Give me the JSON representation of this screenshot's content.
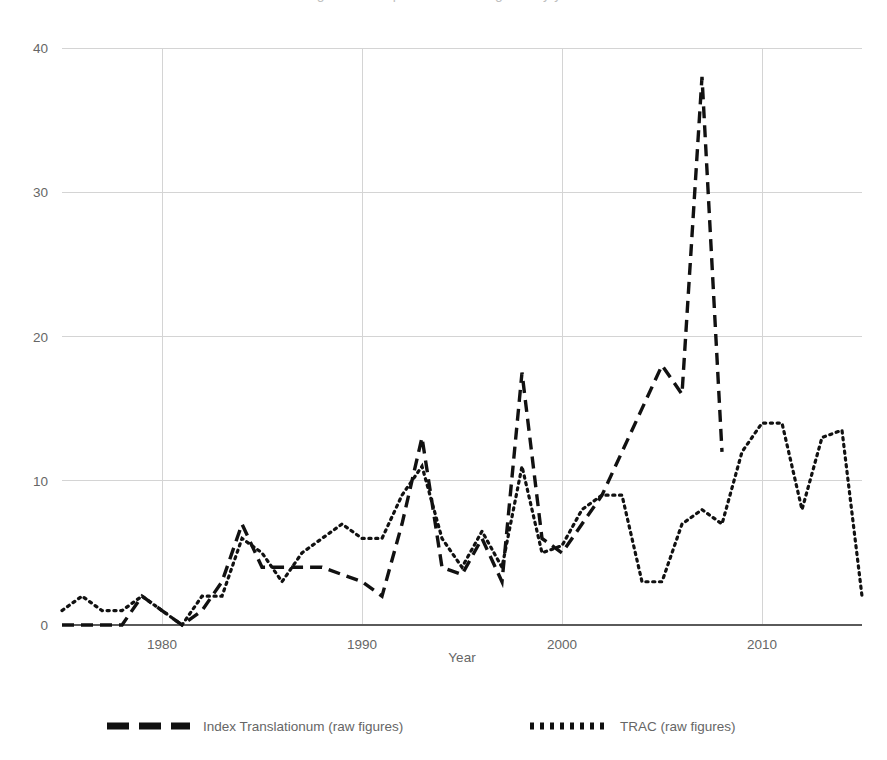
{
  "title_cut": "Figure 1: comparison of raw figures by year",
  "axes": {
    "x_label": "Year",
    "y_label": "",
    "x_ticks": [
      "1980",
      "1990",
      "2000",
      "2010"
    ],
    "y_ticks": [
      "0",
      "10",
      "20",
      "30",
      "40"
    ]
  },
  "legend": {
    "position": "bottom",
    "items": [
      {
        "label": "Index Translationum (raw figures)",
        "style": "dashed",
        "marker": "dash-swatch"
      },
      {
        "label": "TRAC (raw figures)",
        "style": "dotted",
        "marker": "dot-swatch"
      }
    ]
  },
  "colors": {
    "line": "#111111",
    "grid": "#d4d4d4",
    "axis": "#5a5a5a",
    "text": "#666666",
    "background": "#ffffff"
  },
  "chart_data": {
    "type": "line",
    "title": "",
    "xlabel": "Year",
    "ylabel": "",
    "xlim": [
      1975,
      2015
    ],
    "ylim": [
      0,
      40
    ],
    "yticks": [
      0,
      10,
      20,
      30,
      40
    ],
    "xticks": [
      1980,
      1990,
      2000,
      2010
    ],
    "grid": true,
    "legend_position": "bottom",
    "x": [
      1975,
      1976,
      1977,
      1978,
      1979,
      1980,
      1981,
      1982,
      1983,
      1984,
      1985,
      1986,
      1987,
      1988,
      1989,
      1990,
      1991,
      1992,
      1993,
      1994,
      1995,
      1996,
      1997,
      1998,
      1999,
      2000,
      2001,
      2002,
      2003,
      2004,
      2005,
      2006,
      2007,
      2008,
      2009,
      2010,
      2011,
      2012,
      2013,
      2014,
      2015
    ],
    "series": [
      {
        "name": "Index Translationum (raw figures)",
        "style": "dashed",
        "x": [
          1975,
          1976,
          1977,
          1978,
          1979,
          1980,
          1981,
          1982,
          1983,
          1984,
          1985,
          1986,
          1987,
          1988,
          1989,
          1990,
          1991,
          1992,
          1993,
          1994,
          1995,
          1996,
          1997,
          1998,
          1999,
          2000,
          2001,
          2002,
          2003,
          2004,
          2005,
          2006,
          2007,
          2008
        ],
        "values": [
          0,
          0,
          0,
          0,
          2,
          1,
          0,
          1,
          3,
          7,
          4,
          4,
          4,
          4,
          3.5,
          3,
          2,
          7,
          13,
          4,
          3.5,
          6,
          3,
          17.5,
          6,
          5,
          7,
          9,
          12,
          15,
          18,
          16,
          38,
          12
        ]
      },
      {
        "name": "TRAC (raw figures)",
        "style": "dotted",
        "x": [
          1975,
          1976,
          1977,
          1978,
          1979,
          1980,
          1981,
          1982,
          1983,
          1984,
          1985,
          1986,
          1987,
          1988,
          1989,
          1990,
          1991,
          1992,
          1993,
          1994,
          1995,
          1996,
          1997,
          1998,
          1999,
          2000,
          2001,
          2002,
          2003,
          2004,
          2005,
          2006,
          2007,
          2008,
          2009,
          2010,
          2011,
          2012,
          2013,
          2014,
          2015
        ],
        "values": [
          1,
          2,
          1,
          1,
          2,
          1,
          0,
          2,
          2,
          6,
          5,
          3,
          5,
          6,
          7,
          6,
          6,
          9,
          11,
          6,
          4,
          6.5,
          4,
          11,
          5,
          5.5,
          8,
          9,
          9,
          3,
          3,
          7,
          8,
          7,
          12,
          14,
          14,
          8,
          13,
          13.5,
          2
        ]
      }
    ]
  }
}
